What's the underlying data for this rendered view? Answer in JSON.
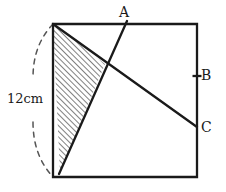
{
  "figure": {
    "type": "geometry-diagram",
    "colors": {
      "stroke": "#1a1a1a",
      "hatch": "#222222",
      "dashed": "#555555",
      "background": "#ffffff"
    },
    "labels": [
      {
        "id": "A",
        "text": "A",
        "x": 119,
        "y": 5
      },
      {
        "id": "B",
        "text": "B",
        "x": 201,
        "y": 68
      },
      {
        "id": "C",
        "text": "C",
        "x": 201,
        "y": 120
      },
      {
        "id": "length",
        "text": "12cm",
        "x": 7,
        "y": 92
      }
    ],
    "square": {
      "top_left": [
        53,
        24
      ],
      "top_right": [
        197,
        24
      ],
      "bottom_right": [
        197,
        177
      ],
      "bottom_left": [
        53,
        177
      ],
      "stroke_width": 2.2
    },
    "segments": [
      {
        "name": "line-to-A",
        "from": [
          60,
          173
        ],
        "to": [
          127,
          21
        ],
        "note": "line rising from near bottom-left corner up to point A above the top edge"
      },
      {
        "name": "diagonal-to-C",
        "from": [
          53,
          24
        ],
        "to": [
          197,
          127
        ],
        "note": "diagonal from top-left corner of square down to point C on the right edge"
      }
    ],
    "shaded_triangle": {
      "name": "hatched-region",
      "vertices": [
        [
          53,
          24
        ],
        [
          105,
          64
        ],
        [
          60,
          173
        ]
      ],
      "fill": "diagonal-hatch",
      "hatch_angle_deg": 45,
      "hatch_spacing_px": 4
    },
    "dashed_arc": {
      "name": "arc-12cm",
      "from": [
        53,
        24
      ],
      "to": [
        53,
        177
      ],
      "bulge_x": 18,
      "measures": "12cm"
    },
    "tick_marks": [
      {
        "name": "tick-B",
        "x": 197,
        "y": 76
      }
    ]
  }
}
